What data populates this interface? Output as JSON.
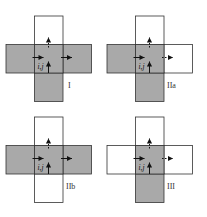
{
  "colors": {
    "shaded": "#a9a9a9",
    "empty": "#ffffff",
    "stroke": "#333333",
    "arrow": "#111111"
  },
  "cell_label": "i,j",
  "panels": [
    {
      "id": "I",
      "label": "I",
      "ox": 6,
      "oy": 16,
      "label_x": 68,
      "label_y": 81,
      "cells": {
        "top": "white",
        "left": "shaded",
        "center": "shaded",
        "right": "shaded",
        "bottom": "shaded"
      },
      "right_arrow": "solid"
    },
    {
      "id": "IIa",
      "label": "IIa",
      "ox": 107,
      "oy": 16,
      "label_x": 168,
      "label_y": 81,
      "cells": {
        "top": "white",
        "left": "shaded",
        "center": "shaded",
        "right": "white",
        "bottom": "shaded"
      },
      "right_arrow": "dotted"
    },
    {
      "id": "IIb",
      "label": "IIb",
      "ox": 6,
      "oy": 117,
      "label_x": 67,
      "label_y": 182,
      "cells": {
        "top": "white",
        "left": "shaded",
        "center": "shaded",
        "right": "shaded",
        "bottom": "white"
      },
      "right_arrow": "solid"
    },
    {
      "id": "III",
      "label": "III",
      "ox": 107,
      "oy": 117,
      "label_x": 168,
      "label_y": 182,
      "cells": {
        "top": "white",
        "left": "white",
        "center": "shaded",
        "right": "white",
        "bottom": "shaded"
      },
      "right_arrow": "dotted"
    }
  ]
}
